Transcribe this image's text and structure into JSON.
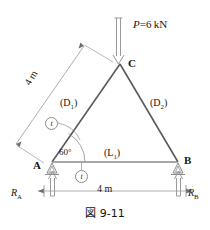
{
  "figure": {
    "caption": "図 9-11",
    "caption_icon": "figure-caption"
  },
  "load": {
    "label": "P",
    "equals": "=",
    "value": "6",
    "unit": "kN",
    "full": "P = 6 kN",
    "arrow": "down-arrow-icon"
  },
  "nodes": [
    {
      "id": "C",
      "label": "C",
      "x": 120,
      "y": 64
    },
    {
      "id": "A",
      "label": "A",
      "x": 52,
      "y": 162
    },
    {
      "id": "B",
      "label": "B",
      "x": 178,
      "y": 162
    }
  ],
  "members": {
    "diagonal_left": "(D",
    "diagonal_left_sub": "1",
    "diagonal_left_close": ")",
    "diagonal_right": "(D",
    "diagonal_right_sub": "2",
    "diagonal_right_close": ")",
    "bottom_chord": "(L",
    "bottom_chord_sub": "1",
    "bottom_chord_close": ")"
  },
  "angle": {
    "label": "60",
    "symbol": "°",
    "full": "60°"
  },
  "dimensions": {
    "slant": "4 m",
    "base": "4 m"
  },
  "reactions": {
    "left_label": "R",
    "left_sub": "A",
    "right_label": "R",
    "right_sub": "B",
    "arrow": "up-arrow-icon"
  },
  "markers": {
    "tension_1": "t",
    "tension_2": "t"
  },
  "colors": {
    "line": "#6e6e6e",
    "member": "#5a5a5a",
    "text": "#161616",
    "dimension": "#8c8c8c",
    "background": "#ffffff"
  }
}
